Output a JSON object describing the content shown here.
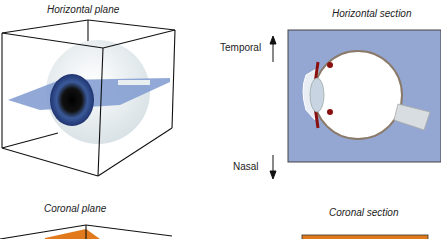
{
  "panels": {
    "horizontal_plane": {
      "caption": "Horizontal plane"
    },
    "horizontal_section": {
      "caption": "Horizontal section",
      "arrow_up_label": "Temporal",
      "arrow_down_label": "Nasal"
    },
    "coronal_plane": {
      "caption": "Coronal plane"
    },
    "coronal_section": {
      "caption": "Coronal section"
    }
  },
  "colors": {
    "plane_blue": "#8ea6d6",
    "section_bg": "#93a7d2",
    "coronal_orange": "#e07a1c",
    "choroid_red": "#8a1010",
    "iris_blue": "#2a4a8a"
  }
}
